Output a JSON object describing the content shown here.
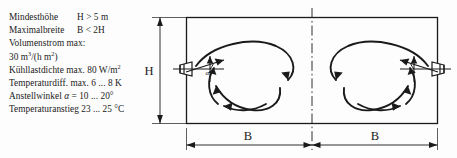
{
  "spec": {
    "lines": [
      {
        "label": "Mindesthöhe",
        "value": "H > 5 m",
        "twocol": true
      },
      {
        "label": "Maximalbreite",
        "value": "B < 2H",
        "twocol": true
      },
      {
        "label": "Volumenstrom max:",
        "value": "",
        "twocol": false
      },
      {
        "label": "",
        "value": "",
        "twocol": false,
        "html_id": "flow"
      },
      {
        "label": "",
        "value": "",
        "twocol": false,
        "html_id": "cool"
      },
      {
        "label": "Temperaturdiff. max. 6 ... 8 K",
        "value": "",
        "twocol": false
      },
      {
        "label": "",
        "value": "",
        "twocol": false,
        "html_id": "angle"
      },
      {
        "label": "Temperaturanstieg 23 ... 25 °C",
        "value": "",
        "twocol": false
      }
    ],
    "flow_rate": {
      "pre": "30 m",
      "sup1": "3",
      "mid": "/(h m",
      "sup2": "2",
      "post": ")"
    },
    "cooling_load": {
      "pre": "Kühllastdichte max. 80 W/m",
      "sup1": "2",
      "post": ""
    },
    "angle_spec": {
      "pre": "Anstellwinkel ",
      "symbol": "α",
      "post": " = 10 ... 20°"
    }
  },
  "diagram": {
    "height_label": "H",
    "width_label_left": "B",
    "width_label_right": "B",
    "alpha_symbol": "α",
    "colors": {
      "line": "#1a1a1a",
      "background": "#fdfdfd"
    }
  }
}
